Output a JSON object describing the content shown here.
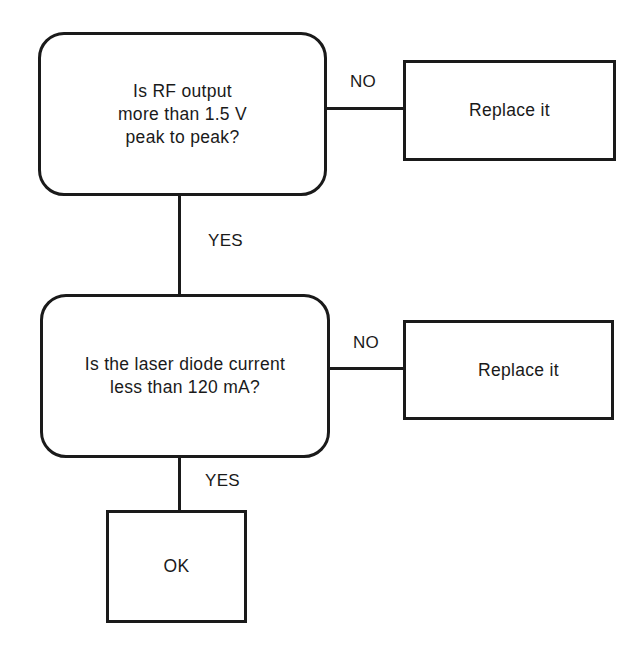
{
  "diagram": {
    "type": "flowchart",
    "nodes": [
      {
        "id": "q1",
        "kind": "decision",
        "text": "Is RF output\nmore than 1.5 V\npeak to peak?"
      },
      {
        "id": "r1",
        "kind": "action",
        "text": "Replace it"
      },
      {
        "id": "q2",
        "kind": "decision",
        "text": "Is the laser diode current\nless than 120 mA?"
      },
      {
        "id": "r2",
        "kind": "action",
        "text": "Replace it"
      },
      {
        "id": "ok",
        "kind": "terminal",
        "text": "OK"
      }
    ],
    "edges": [
      {
        "from": "q1",
        "to": "r1",
        "label": "NO"
      },
      {
        "from": "q1",
        "to": "q2",
        "label": "YES"
      },
      {
        "from": "q2",
        "to": "r2",
        "label": "NO"
      },
      {
        "from": "q2",
        "to": "ok",
        "label": "YES"
      }
    ]
  }
}
